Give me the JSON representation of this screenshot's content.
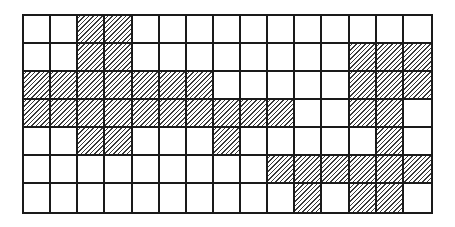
{
  "diagram": {
    "type": "hatched-grid",
    "columns": 15,
    "rows": 7,
    "colors": {
      "grid_line": "#1a1a1a",
      "hatch": "#3a3a3a",
      "background": "#ffffff"
    },
    "hatch_direction": "diagonal-forward-slash",
    "shaded_cells_by_row": [
      [
        2,
        3
      ],
      [
        2,
        3,
        12,
        13,
        14
      ],
      [
        0,
        1,
        2,
        3,
        4,
        5,
        6,
        12,
        13,
        14
      ],
      [
        0,
        1,
        2,
        3,
        4,
        5,
        6,
        7,
        8,
        9,
        12,
        13
      ],
      [
        2,
        3,
        7,
        13
      ],
      [
        9,
        10,
        11,
        12,
        13,
        14
      ],
      [
        10,
        12,
        13
      ]
    ],
    "shaded_count": 45
  }
}
